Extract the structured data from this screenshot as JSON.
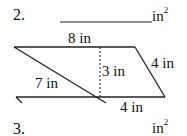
{
  "problems": [
    {
      "number": "2.",
      "unit": "in",
      "exponent": "2"
    },
    {
      "number": "3.",
      "unit": "in",
      "exponent": "2"
    }
  ],
  "figure": {
    "shape": "parallelogram",
    "labels": {
      "top": "8 in",
      "diagonal": "7 in",
      "height": "3 in",
      "right_side": "4 in",
      "bottom_segment": "4 in"
    }
  }
}
